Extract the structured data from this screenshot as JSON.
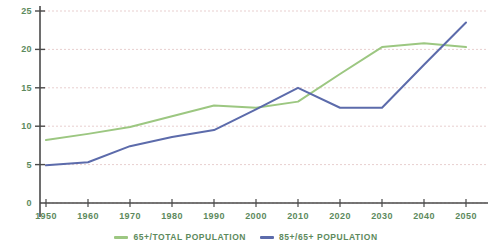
{
  "chart_data": {
    "type": "line",
    "title": "",
    "subtitle": "",
    "xlabel": "",
    "ylabel": "",
    "x": [
      1950,
      1960,
      1970,
      1980,
      1990,
      2000,
      2010,
      2020,
      2030,
      2040,
      2050
    ],
    "categories": [
      "1950",
      "1960",
      "1970",
      "1980",
      "1990",
      "2000",
      "2010",
      "2020",
      "2030",
      "2040",
      "2050"
    ],
    "series": [
      {
        "name": "65+/Total Population",
        "color": "#9cc781",
        "values": [
          8.2,
          9.0,
          9.9,
          11.3,
          12.7,
          12.4,
          13.2,
          16.8,
          20.3,
          20.8,
          20.3
        ]
      },
      {
        "name": "85+/65+ Population",
        "color": "#5c6bab",
        "values": [
          4.9,
          5.3,
          7.4,
          8.6,
          9.5,
          12.2,
          15.0,
          12.4,
          12.4,
          18.0,
          23.5
        ]
      }
    ],
    "xlim": [
      1950,
      2050
    ],
    "ylim": [
      0,
      25
    ],
    "ytick_values": [
      0,
      5,
      10,
      15,
      20,
      25
    ],
    "ytick_labels": [
      "0",
      "5",
      "10",
      "15",
      "20",
      "25"
    ],
    "xtick_labels": [
      "1950",
      "1960",
      "1970",
      "1980",
      "1990",
      "2000",
      "2010",
      "2020",
      "2030",
      "2040",
      "2050"
    ],
    "grid": true,
    "grid_color": "#e8cfcf",
    "axis_color": "#4a4a4a",
    "tick_text_color": "#5d8a5d",
    "legend_position": "bottom"
  },
  "legend": {
    "entries": [
      {
        "label": "65+/Total Population",
        "color": "#9cc781"
      },
      {
        "label": "85+/65+ Population",
        "color": "#5c6bab"
      }
    ]
  }
}
